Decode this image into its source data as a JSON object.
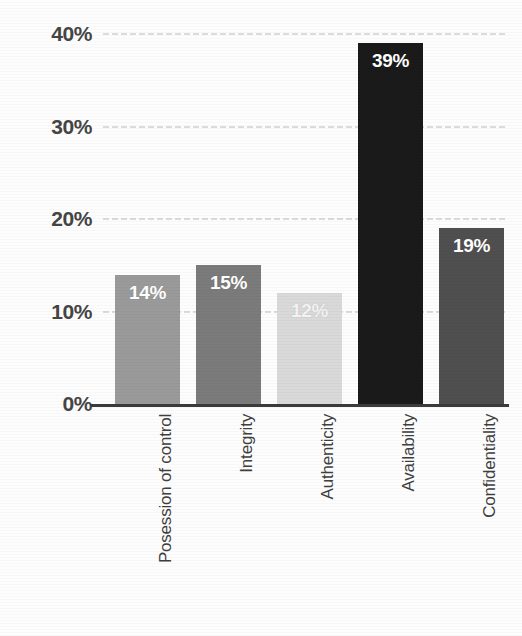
{
  "chart_data": {
    "type": "bar",
    "title": "",
    "subtitle": "",
    "xlabel": "",
    "ylabel": "",
    "categories": [
      "Posession of control",
      "Integrity",
      "Authenticity",
      "Availability",
      "Confidentiality"
    ],
    "values": [
      14,
      15,
      12,
      39,
      19
    ],
    "data_labels": [
      "14%",
      "15%",
      "12%",
      "39%",
      "19%"
    ],
    "bar_colors": [
      "#9a9a9a",
      "#7b7b7b",
      "#d9d9d9",
      "#1a1a1a",
      "#4f4f4f"
    ],
    "ylim": [
      0,
      40
    ],
    "ytick_values": [
      40,
      30,
      20,
      10,
      0
    ],
    "ytick_labels": [
      "40%",
      "30%",
      "20%",
      "10%",
      "0%"
    ],
    "grid": true,
    "grid_axis": "y",
    "legend": false,
    "legend_position": "none",
    "value_suffix": "%",
    "axis_color": "#3b3b3b",
    "gridline_color": "#969696",
    "label_text_color": "#454545",
    "data_label_color": "#ffffff",
    "background_color": "#fdfdfd"
  }
}
